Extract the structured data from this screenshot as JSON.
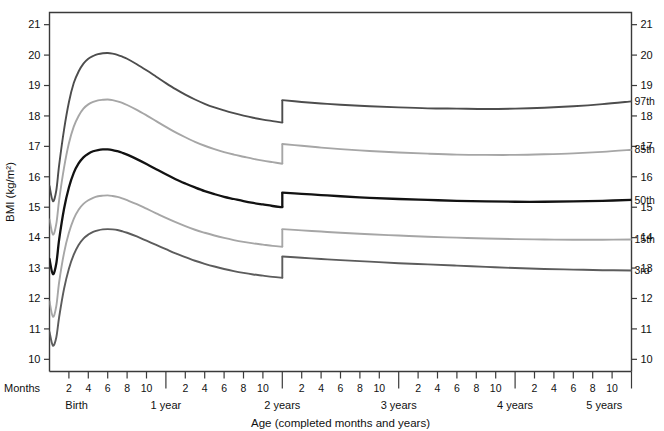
{
  "chart_data": {
    "type": "line",
    "title": "",
    "xlabel": "Age (completed months and years)",
    "ylabel": "BMI (kg/m²)",
    "ylim": [
      9.6,
      21.4
    ],
    "xlim": [
      0,
      60
    ],
    "grid": false,
    "legend_position": "right-of-axis-inline-labels",
    "y_ticks": [
      10,
      11,
      12,
      13,
      14,
      15,
      16,
      17,
      18,
      19,
      20,
      21
    ],
    "y_tick_labels": [
      "10",
      "11",
      "12",
      "13",
      "14",
      "15",
      "16",
      "17",
      "18",
      "19",
      "20",
      "21"
    ],
    "x_month_ticks": [
      2,
      4,
      6,
      8,
      10
    ],
    "x_month_tick_labels": [
      "2",
      "4",
      "6",
      "8",
      "10"
    ],
    "x_year_dividers": [
      12,
      24,
      36,
      48,
      60
    ],
    "x_year_labels": [
      "Birth",
      "1 year",
      "2 years",
      "3 years",
      "4 years",
      "5 years"
    ],
    "months_axis_label": "Months",
    "discontinuity_at_months": 24,
    "series": [
      {
        "name": "97th",
        "label": "97th",
        "color": "#4d4d4d",
        "width": 1.9,
        "points_infant": [
          [
            0,
            15.7
          ],
          [
            0.35,
            15.2
          ],
          [
            0.7,
            15.55
          ],
          [
            1,
            16.4
          ],
          [
            1.5,
            17.55
          ],
          [
            2,
            18.45
          ],
          [
            2.5,
            19.08
          ],
          [
            3,
            19.46
          ],
          [
            3.5,
            19.72
          ],
          [
            4,
            19.88
          ],
          [
            4.5,
            19.97
          ],
          [
            5,
            20.03
          ],
          [
            5.5,
            20.06
          ],
          [
            6,
            20.07
          ],
          [
            6.5,
            20.05
          ],
          [
            7,
            20.01
          ],
          [
            7.5,
            19.95
          ],
          [
            8,
            19.88
          ],
          [
            9,
            19.7
          ],
          [
            10,
            19.5
          ],
          [
            11,
            19.29
          ],
          [
            12,
            19.08
          ],
          [
            13,
            18.88
          ],
          [
            14,
            18.7
          ],
          [
            15,
            18.54
          ],
          [
            16,
            18.4
          ],
          [
            17,
            18.28
          ],
          [
            18,
            18.18
          ],
          [
            19,
            18.09
          ],
          [
            20,
            18.01
          ],
          [
            21,
            17.94
          ],
          [
            22,
            17.88
          ],
          [
            23,
            17.83
          ],
          [
            24,
            17.78
          ]
        ],
        "points_child": [
          [
            24,
            18.52
          ],
          [
            26,
            18.46
          ],
          [
            28,
            18.41
          ],
          [
            30,
            18.37
          ],
          [
            33,
            18.32
          ],
          [
            36,
            18.28
          ],
          [
            39,
            18.25
          ],
          [
            42,
            18.24
          ],
          [
            45,
            18.23
          ],
          [
            48,
            18.24
          ],
          [
            51,
            18.27
          ],
          [
            54,
            18.32
          ],
          [
            57,
            18.39
          ],
          [
            60,
            18.48
          ]
        ]
      },
      {
        "name": "85th",
        "label": "85th",
        "color": "#a6a6a6",
        "width": 1.9,
        "points_infant": [
          [
            0,
            14.6
          ],
          [
            0.35,
            14.1
          ],
          [
            0.7,
            14.45
          ],
          [
            1,
            15.25
          ],
          [
            1.5,
            16.3
          ],
          [
            2,
            17.1
          ],
          [
            2.5,
            17.65
          ],
          [
            3,
            18.0
          ],
          [
            3.5,
            18.24
          ],
          [
            4,
            18.38
          ],
          [
            4.5,
            18.46
          ],
          [
            5,
            18.51
          ],
          [
            5.5,
            18.53
          ],
          [
            6,
            18.54
          ],
          [
            6.5,
            18.52
          ],
          [
            7,
            18.48
          ],
          [
            7.5,
            18.43
          ],
          [
            8,
            18.36
          ],
          [
            9,
            18.2
          ],
          [
            10,
            18.02
          ],
          [
            11,
            17.83
          ],
          [
            12,
            17.64
          ],
          [
            13,
            17.46
          ],
          [
            14,
            17.3
          ],
          [
            15,
            17.15
          ],
          [
            16,
            17.02
          ],
          [
            17,
            16.91
          ],
          [
            18,
            16.81
          ],
          [
            19,
            16.73
          ],
          [
            20,
            16.66
          ],
          [
            21,
            16.59
          ],
          [
            22,
            16.53
          ],
          [
            23,
            16.48
          ],
          [
            24,
            16.43
          ]
        ],
        "points_child": [
          [
            24,
            17.08
          ],
          [
            26,
            17.02
          ],
          [
            28,
            16.96
          ],
          [
            30,
            16.91
          ],
          [
            33,
            16.85
          ],
          [
            36,
            16.8
          ],
          [
            39,
            16.76
          ],
          [
            42,
            16.73
          ],
          [
            45,
            16.72
          ],
          [
            48,
            16.72
          ],
          [
            51,
            16.74
          ],
          [
            54,
            16.77
          ],
          [
            57,
            16.82
          ],
          [
            60,
            16.89
          ]
        ]
      },
      {
        "name": "50th",
        "label": "50th",
        "color": "#121212",
        "width": 2.3,
        "points_infant": [
          [
            0,
            13.3
          ],
          [
            0.35,
            12.8
          ],
          [
            0.7,
            13.15
          ],
          [
            1,
            13.95
          ],
          [
            1.5,
            14.95
          ],
          [
            2,
            15.65
          ],
          [
            2.5,
            16.13
          ],
          [
            3,
            16.44
          ],
          [
            3.5,
            16.64
          ],
          [
            4,
            16.76
          ],
          [
            4.5,
            16.84
          ],
          [
            5,
            16.88
          ],
          [
            5.5,
            16.9
          ],
          [
            6,
            16.9
          ],
          [
            6.5,
            16.88
          ],
          [
            7,
            16.84
          ],
          [
            7.5,
            16.79
          ],
          [
            8,
            16.73
          ],
          [
            9,
            16.58
          ],
          [
            10,
            16.42
          ],
          [
            11,
            16.25
          ],
          [
            12,
            16.08
          ],
          [
            13,
            15.92
          ],
          [
            14,
            15.78
          ],
          [
            15,
            15.65
          ],
          [
            16,
            15.53
          ],
          [
            17,
            15.43
          ],
          [
            18,
            15.34
          ],
          [
            19,
            15.27
          ],
          [
            20,
            15.2
          ],
          [
            21,
            15.14
          ],
          [
            22,
            15.09
          ],
          [
            23,
            15.04
          ],
          [
            24,
            15.0
          ]
        ],
        "points_child": [
          [
            24,
            15.48
          ],
          [
            26,
            15.44
          ],
          [
            28,
            15.4
          ],
          [
            30,
            15.36
          ],
          [
            33,
            15.31
          ],
          [
            36,
            15.27
          ],
          [
            39,
            15.24
          ],
          [
            42,
            15.21
          ],
          [
            45,
            15.19
          ],
          [
            48,
            15.18
          ],
          [
            51,
            15.18
          ],
          [
            54,
            15.19
          ],
          [
            57,
            15.21
          ],
          [
            60,
            15.24
          ]
        ]
      },
      {
        "name": "15th",
        "label": "15th",
        "color": "#a6a6a6",
        "width": 1.9,
        "points_infant": [
          [
            0,
            11.9
          ],
          [
            0.35,
            11.4
          ],
          [
            0.7,
            11.75
          ],
          [
            1,
            12.55
          ],
          [
            1.5,
            13.5
          ],
          [
            2,
            14.16
          ],
          [
            2.5,
            14.62
          ],
          [
            3,
            14.92
          ],
          [
            3.5,
            15.11
          ],
          [
            4,
            15.23
          ],
          [
            4.5,
            15.31
          ],
          [
            5,
            15.36
          ],
          [
            5.5,
            15.38
          ],
          [
            6,
            15.39
          ],
          [
            6.5,
            15.37
          ],
          [
            7,
            15.34
          ],
          [
            7.5,
            15.29
          ],
          [
            8,
            15.23
          ],
          [
            9,
            15.1
          ],
          [
            10,
            14.95
          ],
          [
            11,
            14.8
          ],
          [
            12,
            14.65
          ],
          [
            13,
            14.51
          ],
          [
            14,
            14.38
          ],
          [
            15,
            14.26
          ],
          [
            16,
            14.16
          ],
          [
            17,
            14.07
          ],
          [
            18,
            13.99
          ],
          [
            19,
            13.92
          ],
          [
            20,
            13.86
          ],
          [
            21,
            13.81
          ],
          [
            22,
            13.77
          ],
          [
            23,
            13.73
          ],
          [
            24,
            13.7
          ]
        ],
        "points_child": [
          [
            24,
            14.28
          ],
          [
            26,
            14.24
          ],
          [
            28,
            14.2
          ],
          [
            30,
            14.16
          ],
          [
            33,
            14.11
          ],
          [
            36,
            14.07
          ],
          [
            39,
            14.03
          ],
          [
            42,
            14.0
          ],
          [
            45,
            13.97
          ],
          [
            48,
            13.95
          ],
          [
            51,
            13.94
          ],
          [
            54,
            13.93
          ],
          [
            57,
            13.93
          ],
          [
            60,
            13.94
          ]
        ]
      },
      {
        "name": "3rd",
        "label": "3rd",
        "color": "#5c5c5c",
        "width": 1.9,
        "points_infant": [
          [
            0,
            10.9
          ],
          [
            0.35,
            10.45
          ],
          [
            0.7,
            10.72
          ],
          [
            1,
            11.4
          ],
          [
            1.5,
            12.32
          ],
          [
            2,
            12.98
          ],
          [
            2.5,
            13.44
          ],
          [
            3,
            13.76
          ],
          [
            3.5,
            13.97
          ],
          [
            4,
            14.1
          ],
          [
            4.5,
            14.19
          ],
          [
            5,
            14.24
          ],
          [
            5.5,
            14.27
          ],
          [
            6,
            14.28
          ],
          [
            6.5,
            14.27
          ],
          [
            7,
            14.25
          ],
          [
            7.5,
            14.21
          ],
          [
            8,
            14.16
          ],
          [
            9,
            14.04
          ],
          [
            10,
            13.9
          ],
          [
            11,
            13.76
          ],
          [
            12,
            13.62
          ],
          [
            13,
            13.48
          ],
          [
            14,
            13.36
          ],
          [
            15,
            13.24
          ],
          [
            16,
            13.14
          ],
          [
            17,
            13.05
          ],
          [
            18,
            12.97
          ],
          [
            19,
            12.9
          ],
          [
            20,
            12.84
          ],
          [
            21,
            12.79
          ],
          [
            22,
            12.75
          ],
          [
            23,
            12.71
          ],
          [
            24,
            12.68
          ]
        ],
        "points_child": [
          [
            24,
            13.38
          ],
          [
            26,
            13.34
          ],
          [
            28,
            13.3
          ],
          [
            30,
            13.26
          ],
          [
            33,
            13.21
          ],
          [
            36,
            13.16
          ],
          [
            39,
            13.12
          ],
          [
            42,
            13.08
          ],
          [
            45,
            13.04
          ],
          [
            48,
            13.0
          ],
          [
            51,
            12.97
          ],
          [
            54,
            12.95
          ],
          [
            57,
            12.93
          ],
          [
            60,
            12.92
          ]
        ]
      }
    ]
  },
  "axes": {
    "y_title": "BMI (kg/m²)",
    "x_title": "Age (completed months and years)",
    "months_label": "Months"
  }
}
